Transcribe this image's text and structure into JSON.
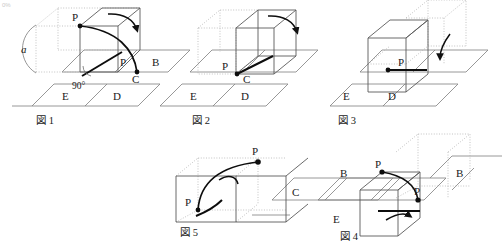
{
  "document": {
    "kind": "geometry-diagram",
    "language": "ja",
    "corner_mark": "0%",
    "colors": {
      "ink": "#1a1a1a",
      "solid_line": "#555555",
      "dotted_line": "#9a9a9a",
      "ground_line": "#777777",
      "accent_path": "#000000"
    }
  },
  "figures": [
    {
      "id": "fig1",
      "caption": "図 1",
      "labels": {
        "p_top": "P",
        "p_bottom": "P",
        "angle": "90°",
        "arc_label": "a",
        "cell_b": "B",
        "cell_c": "C",
        "cell_d": "D",
        "cell_e": "E"
      }
    },
    {
      "id": "fig2",
      "caption": "図 2",
      "labels": {
        "p_bottom": "P",
        "cell_c": "C",
        "cell_d": "D",
        "cell_e": "E"
      }
    },
    {
      "id": "fig3",
      "caption": "図 3",
      "labels": {
        "p_mid": "P",
        "cell_d": "D",
        "cell_e": "E"
      }
    },
    {
      "id": "fig4",
      "caption": "図 4",
      "labels": {
        "p_top": "P",
        "p_mid": "P",
        "cell_b": "B",
        "cell_e": "E"
      }
    },
    {
      "id": "fig5",
      "caption": "図 5",
      "labels": {
        "p_top": "P",
        "p_left": "P",
        "cell_b": "B",
        "cell_c": "C"
      }
    }
  ]
}
